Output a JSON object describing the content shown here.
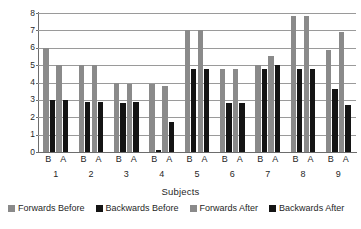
{
  "chart_data": {
    "type": "bar",
    "title": "",
    "xlabel": "Subjects",
    "ylabel": "Scores",
    "categories": [
      "1",
      "2",
      "3",
      "4",
      "5",
      "6",
      "7",
      "8",
      "9"
    ],
    "group_tick_labels": [
      "B",
      "A"
    ],
    "ylim": [
      0,
      8
    ],
    "yticks": [
      0,
      1,
      2,
      3,
      4,
      5,
      6,
      7,
      8
    ],
    "ytick_labels": [
      "0",
      "1",
      "2",
      "3",
      "4",
      "5",
      "6",
      "7",
      "8"
    ],
    "grid": true,
    "grid_axis": "y",
    "legend_position": "bottom",
    "series": [
      {
        "name": "Forwards Before",
        "color": "#8a8a8a",
        "values": [
          6.0,
          5.0,
          4.0,
          3.9,
          7.0,
          4.8,
          5.0,
          7.8,
          5.9
        ]
      },
      {
        "name": "Backwards Before",
        "color": "#141414",
        "values": [
          3.0,
          2.9,
          2.8,
          0.1,
          4.8,
          2.8,
          4.8,
          4.8,
          3.6
        ]
      },
      {
        "name": "Forwards After",
        "color": "#8a8a8a",
        "values": [
          5.0,
          5.0,
          3.9,
          3.8,
          7.0,
          4.8,
          5.5,
          7.8,
          6.9
        ]
      },
      {
        "name": "Backwards After",
        "color": "#141414",
        "values": [
          3.0,
          2.9,
          2.9,
          1.7,
          4.8,
          2.8,
          5.0,
          4.8,
          2.7
        ]
      }
    ]
  },
  "legend": {
    "items": [
      {
        "label": "Forwards Before",
        "color": "#8a8a8a"
      },
      {
        "label": "Backwards Before",
        "color": "#141414"
      },
      {
        "label": "Forwards After",
        "color": "#8a8a8a"
      },
      {
        "label": "Backwards After",
        "color": "#141414"
      }
    ]
  },
  "axes": {
    "y_title": "Scores",
    "x_title": "Subjects"
  }
}
